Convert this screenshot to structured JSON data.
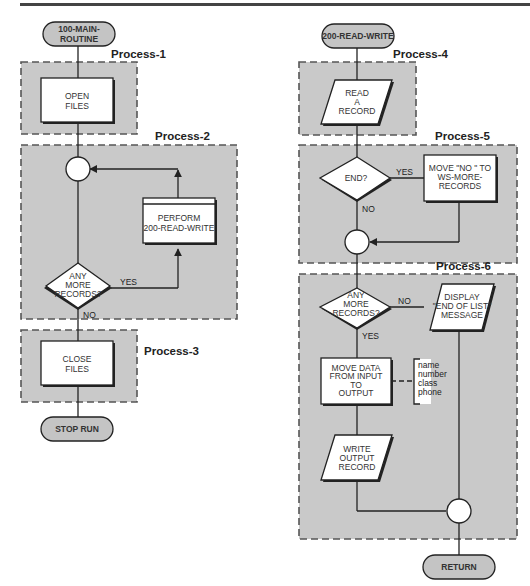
{
  "diagram": {
    "type": "flowchart",
    "left_column": {
      "start_terminal": [
        "100-MAIN-",
        "ROUTINE"
      ],
      "end_terminal": "STOP RUN",
      "regions": [
        {
          "id": "process-1",
          "label": "Process-1"
        },
        {
          "id": "process-2",
          "label": "Process-2"
        },
        {
          "id": "process-3",
          "label": "Process-3"
        }
      ],
      "nodes": {
        "open_files": [
          "OPEN",
          "FILES"
        ],
        "perform": [
          "PERFORM",
          "200-READ-WRITE"
        ],
        "decision": [
          "ANY",
          "MORE",
          "RECORDS?"
        ],
        "close_files": [
          "CLOSE",
          "FILES"
        ]
      },
      "edges": {
        "yes": "YES",
        "no": "NO"
      }
    },
    "right_column": {
      "start_terminal": "200-READ-WRITE",
      "end_terminal": "RETURN",
      "regions": [
        {
          "id": "process-4",
          "label": "Process-4"
        },
        {
          "id": "process-5",
          "label": "Process-5"
        },
        {
          "id": "process-6",
          "label": "Process-6"
        }
      ],
      "nodes": {
        "read_record": [
          "READ",
          "A",
          "RECORD"
        ],
        "end_decision": [
          "END?"
        ],
        "move_no": [
          "MOVE \"NO  \" TO",
          "WS-MORE-",
          "RECORDS"
        ],
        "more_decision": [
          "ANY",
          "MORE",
          "RECORDS?"
        ],
        "display_msg": [
          "DISPLAY",
          "\"END OF LIST\"",
          "MESSAGE"
        ],
        "move_data": [
          "MOVE DATA",
          "FROM INPUT",
          "TO",
          "OUTPUT"
        ],
        "annotation": [
          "name",
          "number",
          "class",
          "phone"
        ],
        "write_record": [
          "WRITE",
          "OUTPUT",
          "RECORD"
        ]
      },
      "edges": {
        "end_yes": "YES",
        "end_no": "NO",
        "more_no": "NO",
        "more_yes": "YES"
      }
    }
  }
}
